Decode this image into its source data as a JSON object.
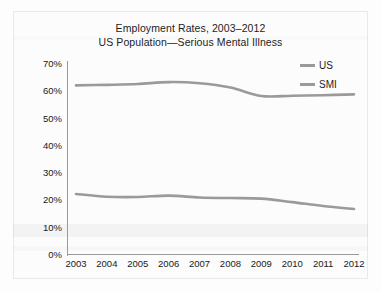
{
  "chart_data": {
    "type": "line",
    "title": "Employment Rates, 2003–2012",
    "subtitle": "US Population—Serious Mental Illness",
    "xlabel": "",
    "ylabel": "",
    "categories": [
      "2003",
      "2004",
      "2005",
      "2006",
      "2007",
      "2008",
      "2009",
      "2010",
      "2011",
      "2012"
    ],
    "x": [
      2003,
      2004,
      2005,
      2006,
      2007,
      2008,
      2009,
      2010,
      2011,
      2012
    ],
    "ylim": [
      0,
      70
    ],
    "ytick_values": [
      0,
      10,
      20,
      30,
      40,
      50,
      60,
      70
    ],
    "ytick_labels": [
      "0%",
      "10%",
      "20%",
      "30%",
      "40%",
      "50%",
      "60%",
      "70%"
    ],
    "grid": false,
    "legend_position": "top-right",
    "series": [
      {
        "name": "US",
        "color": "#9a9a9a",
        "values": [
          61.8,
          62.0,
          62.3,
          63.0,
          62.6,
          61.0,
          57.9,
          58.0,
          58.2,
          58.5
        ]
      },
      {
        "name": "SMI",
        "color": "#9a9a9a",
        "values": [
          22.0,
          21.0,
          20.9,
          21.4,
          20.7,
          20.5,
          20.3,
          19.0,
          17.6,
          16.5
        ]
      }
    ]
  },
  "legend": {
    "items": [
      {
        "label": "US"
      },
      {
        "label": "SMI"
      }
    ]
  },
  "colors": {
    "line": "#9a9a9a",
    "axis": "#9a9a9a",
    "text": "#1d1d1d",
    "background": "#fcfcfc"
  }
}
